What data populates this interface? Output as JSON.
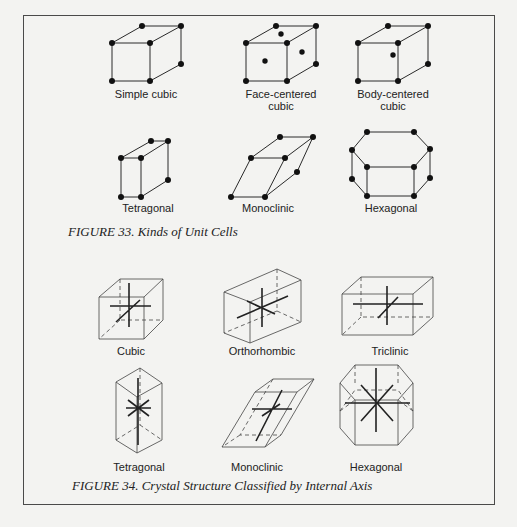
{
  "figure33": {
    "caption": "FIGURE 33. Kinds of Unit Cells",
    "cells": [
      {
        "label_line1": "Simple cubic",
        "label_line2": ""
      },
      {
        "label_line1": "Face-centered",
        "label_line2": "cubic"
      },
      {
        "label_line1": "Body-centered",
        "label_line2": "cubic"
      },
      {
        "label_line1": "Tetragonal",
        "label_line2": ""
      },
      {
        "label_line1": "Monoclinic",
        "label_line2": ""
      },
      {
        "label_line1": "Hexagonal",
        "label_line2": ""
      }
    ]
  },
  "figure34": {
    "caption": "FIGURE 34. Crystal Structure Classified by Internal Axis",
    "structures": [
      {
        "label": "Cubic"
      },
      {
        "label": "Orthorhombic"
      },
      {
        "label": "Triclinic"
      },
      {
        "label": "Tetragonal"
      },
      {
        "label": "Monoclinic"
      },
      {
        "label": "Hexagonal"
      }
    ]
  }
}
